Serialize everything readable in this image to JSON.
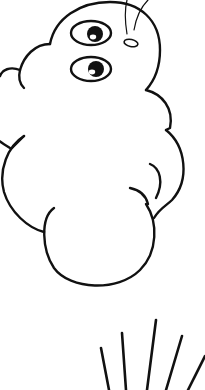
{
  "image": {
    "description": "Line-art cartoon of a puffy cloud-shaped creature with two eyes and a small oval nose, with motion lines below",
    "background": "#ffffff",
    "stroke_color": "#111111",
    "elements": [
      {
        "name": "head",
        "type": "arc"
      },
      {
        "name": "eye-upper",
        "type": "eye"
      },
      {
        "name": "eye-lower",
        "type": "eye"
      },
      {
        "name": "nose",
        "type": "oval"
      },
      {
        "name": "antenna-lines",
        "count": 2
      },
      {
        "name": "cloud-body",
        "type": "puffy-outline"
      },
      {
        "name": "motion-lines",
        "count": 5
      }
    ]
  }
}
